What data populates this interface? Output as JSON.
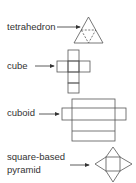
{
  "figure": {
    "stroke_color": "#555555",
    "items": [
      {
        "id": "tetrahedron",
        "label": "tetrahedron",
        "net": "triangle-of-four-triangles"
      },
      {
        "id": "cube",
        "label": "cube",
        "net": "cross-of-six-squares"
      },
      {
        "id": "cuboid",
        "label": "cuboid",
        "net": "cross-of-six-rectangles"
      },
      {
        "id": "square-based-pyramid",
        "label_line1": "square-based",
        "label_line2": "pyramid",
        "net": "square-with-four-triangles"
      }
    ]
  }
}
